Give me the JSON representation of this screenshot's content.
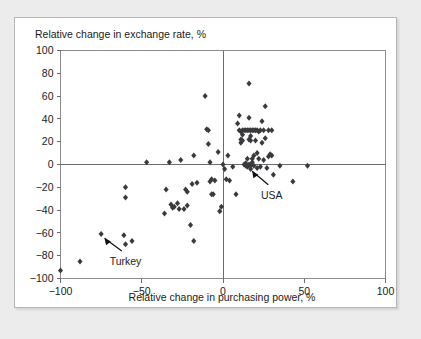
{
  "chart_data": {
    "type": "scatter",
    "title": "",
    "xlabel": "Relative change in purchasing power, %",
    "ylabel": "Relative change in exchange rate, %",
    "xlim": [
      -100,
      100
    ],
    "ylim": [
      -100,
      100
    ],
    "xticks": [
      -100,
      -50,
      0,
      50,
      100
    ],
    "yticks": [
      100,
      80,
      60,
      40,
      20,
      0,
      -20,
      -40,
      -60,
      -80,
      -100
    ],
    "xtick_labels": [
      "-100",
      "-50",
      "0",
      "50",
      "100"
    ],
    "ytick_labels": [
      "100",
      "80",
      "60",
      "40",
      "20",
      "0",
      "-20",
      "-40",
      "-60",
      "-80",
      "-100"
    ],
    "grid": false,
    "legend": null,
    "zero_lines": {
      "x": 0,
      "y": 0
    },
    "marker": {
      "shape": "diamond",
      "color": "#3a3a3d",
      "size": 3
    },
    "annotations": [
      {
        "label": "Turkey",
        "point": [
          -75,
          -61
        ],
        "label_x": -60,
        "label_y": -88,
        "arrow": "up-left"
      },
      {
        "label": "USA",
        "point": [
          16,
          -2
        ],
        "label_x": 30,
        "label_y": -30,
        "arrow": "up-left"
      }
    ],
    "points": [
      [
        -100,
        -93
      ],
      [
        -88,
        -85
      ],
      [
        -75,
        -61
      ],
      [
        -61,
        -62
      ],
      [
        -60,
        -70
      ],
      [
        -56,
        -67
      ],
      [
        -60,
        -20
      ],
      [
        -60,
        -29
      ],
      [
        -47,
        2
      ],
      [
        -35,
        -22
      ],
      [
        -36,
        -43
      ],
      [
        -33,
        2
      ],
      [
        -32,
        -35
      ],
      [
        -31,
        -38
      ],
      [
        -30,
        -37
      ],
      [
        -28,
        -34
      ],
      [
        -27,
        -39
      ],
      [
        -26,
        4
      ],
      [
        -24,
        -39
      ],
      [
        -23,
        -22
      ],
      [
        -22,
        -24
      ],
      [
        -22,
        -36
      ],
      [
        -20,
        -53
      ],
      [
        -19,
        -17
      ],
      [
        -18,
        8
      ],
      [
        -18,
        -67
      ],
      [
        -16,
        -16
      ],
      [
        -11,
        60
      ],
      [
        -10,
        31
      ],
      [
        -9,
        30
      ],
      [
        -9,
        18
      ],
      [
        -8,
        2
      ],
      [
        -8,
        -15
      ],
      [
        -7,
        -13
      ],
      [
        -7,
        -26
      ],
      [
        -6,
        -26
      ],
      [
        -5,
        -14
      ],
      [
        -3,
        11
      ],
      [
        -2,
        -41
      ],
      [
        -1,
        -37
      ],
      [
        0,
        0
      ],
      [
        1,
        -4
      ],
      [
        2,
        -13
      ],
      [
        3,
        8
      ],
      [
        4,
        -14
      ],
      [
        6,
        -2
      ],
      [
        8,
        -26
      ],
      [
        9,
        36
      ],
      [
        10,
        30
      ],
      [
        10,
        43
      ],
      [
        11,
        29
      ],
      [
        11,
        22
      ],
      [
        11,
        19
      ],
      [
        12,
        30
      ],
      [
        12,
        26
      ],
      [
        12,
        21
      ],
      [
        13,
        30
      ],
      [
        13,
        0
      ],
      [
        14,
        30
      ],
      [
        14,
        1
      ],
      [
        14,
        -1
      ],
      [
        15,
        30
      ],
      [
        15,
        -2
      ],
      [
        15,
        5
      ],
      [
        16,
        30
      ],
      [
        16,
        41
      ],
      [
        16,
        22
      ],
      [
        16,
        0
      ],
      [
        16,
        71
      ],
      [
        17,
        30
      ],
      [
        17,
        25
      ],
      [
        17,
        21
      ],
      [
        17,
        -1
      ],
      [
        17,
        -4
      ],
      [
        18,
        30
      ],
      [
        18,
        5
      ],
      [
        18,
        2
      ],
      [
        19,
        30
      ],
      [
        19,
        8
      ],
      [
        19,
        -1
      ],
      [
        20,
        30
      ],
      [
        20,
        21
      ],
      [
        21,
        30
      ],
      [
        21,
        10
      ],
      [
        21,
        -3
      ],
      [
        22,
        29
      ],
      [
        22,
        5
      ],
      [
        23,
        30
      ],
      [
        23,
        -2
      ],
      [
        24,
        38
      ],
      [
        24,
        19
      ],
      [
        25,
        30
      ],
      [
        25,
        4
      ],
      [
        26,
        51
      ],
      [
        26,
        23
      ],
      [
        27,
        -3
      ],
      [
        28,
        30
      ],
      [
        28,
        7
      ],
      [
        29,
        9
      ],
      [
        30,
        30
      ],
      [
        30,
        8
      ],
      [
        31,
        -9
      ],
      [
        35,
        -1
      ],
      [
        43,
        -15
      ],
      [
        52,
        -1
      ]
    ]
  },
  "labels": {
    "ylabel": "Relative change in exchange rate, %",
    "xlabel": "Relative change in purchasing power, %",
    "annotation_turkey": "Turkey",
    "annotation_usa": "USA"
  },
  "colors": {
    "page_background": "#ececed",
    "card_background": "#ffffff",
    "card_border": "#b6b6b8",
    "axis": "#6c6d70",
    "frame": "#8b8c8f",
    "marker": "#3a3a3d",
    "text": "#1b1b1c",
    "annotation": "#111113"
  }
}
